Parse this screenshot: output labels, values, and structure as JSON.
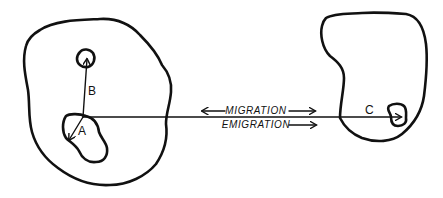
{
  "diagram": {
    "background": "#ffffff",
    "ink_color": "#111111",
    "regions": [
      {
        "id": "left-area",
        "label": ""
      },
      {
        "id": "right-area",
        "label": ""
      }
    ],
    "points": {
      "A": {
        "label": "A"
      },
      "B": {
        "label": "B"
      },
      "C": {
        "label": "C"
      }
    },
    "labels": {
      "migration": "MIGRATION",
      "emigration": "EMIGRATION"
    },
    "arrows": [
      {
        "id": "arrow-b",
        "label": "B",
        "from": "A-junction",
        "to": "small-circle",
        "direction": "up"
      },
      {
        "id": "arrow-a",
        "label": "A",
        "from": "A-junction",
        "to": "blob-a-interior",
        "direction": "down-left"
      },
      {
        "id": "arrow-c",
        "label": "C",
        "from": "A-junction",
        "to": "blob-c",
        "direction": "right"
      },
      {
        "id": "migration-arrows",
        "label": "MIGRATION",
        "direction": "both"
      },
      {
        "id": "emigration-arrow",
        "label": "EMIGRATION",
        "direction": "right"
      }
    ]
  }
}
